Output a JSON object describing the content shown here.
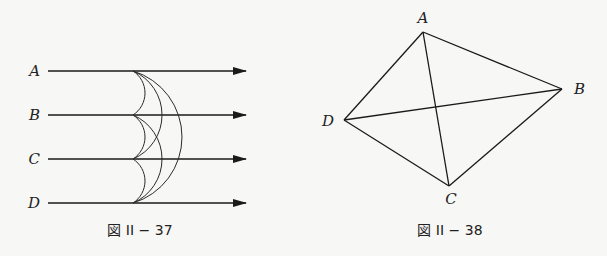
{
  "figures": [
    {
      "id": "fig37",
      "caption": "図 II − 37",
      "rays": [
        {
          "label": "A",
          "y": 71
        },
        {
          "label": "B",
          "y": 115
        },
        {
          "label": "C",
          "y": 159
        },
        {
          "label": "D",
          "y": 203
        }
      ],
      "ray_start_x": 48,
      "ray_end_x": 246,
      "arc_origin_x": 133,
      "arcs": [
        {
          "from": "A",
          "to": "B",
          "bulge_x": 145
        },
        {
          "from": "B",
          "to": "C",
          "bulge_x": 145
        },
        {
          "from": "C",
          "to": "D",
          "bulge_x": 145
        },
        {
          "from": "A",
          "to": "C",
          "bulge_x": 162
        },
        {
          "from": "B",
          "to": "D",
          "bulge_x": 162
        },
        {
          "from": "A",
          "to": "D",
          "bulge_x": 182
        }
      ]
    },
    {
      "id": "fig38",
      "caption": "図 II − 38",
      "vertices": {
        "A": {
          "x": 423,
          "y": 32
        },
        "B": {
          "x": 562,
          "y": 89
        },
        "C": {
          "x": 449,
          "y": 186
        },
        "D": {
          "x": 344,
          "y": 120
        }
      },
      "edges": [
        [
          "A",
          "B"
        ],
        [
          "B",
          "C"
        ],
        [
          "C",
          "D"
        ],
        [
          "D",
          "A"
        ],
        [
          "A",
          "C"
        ],
        [
          "D",
          "B"
        ]
      ]
    }
  ]
}
